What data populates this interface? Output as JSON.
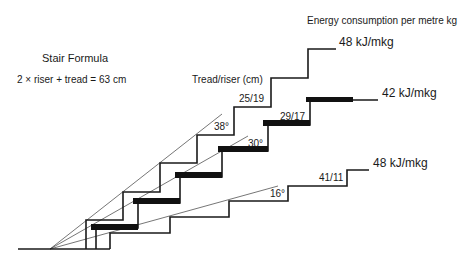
{
  "title": "Stair Formula",
  "formula": "2 × riser + tread = 63 cm",
  "tread_riser_label": "Tread/riser (cm)",
  "energy_heading": "Energy consumption per metre kg",
  "stairs": [
    {
      "id": "steep",
      "tread_riser": "25/19",
      "angle": "38°",
      "energy": "48 kJ/mkg",
      "tread_cm": 25,
      "riser_cm": 19,
      "style": "thin"
    },
    {
      "id": "optimal",
      "tread_riser": "29/17",
      "angle": "30°",
      "energy": "42 kJ/mkg",
      "tread_cm": 29,
      "riser_cm": 17,
      "style": "bold"
    },
    {
      "id": "shallow",
      "tread_riser": "41/11",
      "angle": "16°",
      "energy": "48 kJ/mkg",
      "tread_cm": 41,
      "riser_cm": 11,
      "style": "thin"
    }
  ],
  "colors": {
    "line": "#1a1a1a",
    "background": "#ffffff"
  }
}
